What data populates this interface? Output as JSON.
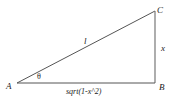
{
  "diagram": {
    "type": "right-triangle",
    "vertices": {
      "A": {
        "label": "A",
        "x": 17,
        "y": 83
      },
      "B": {
        "label": "B",
        "x": 155,
        "y": 83
      },
      "C": {
        "label": "C",
        "x": 155,
        "y": 11
      }
    },
    "edges": {
      "hypotenuse": {
        "from": "A",
        "to": "C",
        "label": "l"
      },
      "opposite": {
        "from": "B",
        "to": "C",
        "label": "x"
      },
      "adjacent": {
        "from": "A",
        "to": "B",
        "label": "sqrt(1-x^2)"
      }
    },
    "angle": {
      "at": "A",
      "label": "θ"
    },
    "colors": {
      "line": "#555555",
      "text": "#222222",
      "background": "#ffffff"
    }
  }
}
